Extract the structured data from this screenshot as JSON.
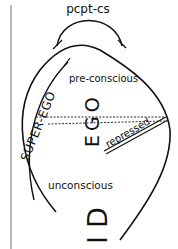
{
  "diagram": {
    "labels": {
      "perception": "pcpt-cs",
      "preconscious": "pre-conscious",
      "unconscious": "unconscious",
      "ego": "EGO",
      "superego": "SUPER-EGO",
      "id": "ID",
      "repressed": "repressed"
    },
    "colors": {
      "line": "#111111",
      "background": "#ffffff",
      "border": "#888888"
    }
  }
}
